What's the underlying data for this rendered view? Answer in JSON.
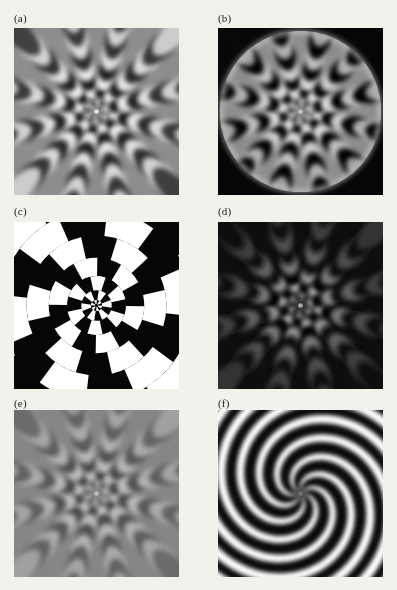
{
  "figure": {
    "kind": "scanned-print-figure",
    "page_background": "#f2f1ec",
    "columns": 2,
    "rows": 3,
    "panels": [
      {
        "id": "a",
        "label": "(a)",
        "shape": "square",
        "description": "Grayscale radial interference pattern, square frame, uniform mid-gray surround",
        "background": "#8a8a8a",
        "mask": "none",
        "sectors": 12,
        "rings": 9,
        "contrast": 1.0,
        "contrast_falloff": "slow",
        "spiral_twist": 0.0,
        "binary": false,
        "x": 14,
        "y": 28,
        "w": 165,
        "h": 167,
        "label_x": 14,
        "label_y": 12
      },
      {
        "id": "b",
        "label": "(b)",
        "shape": "square",
        "description": "Same radial pattern masked by a circular aperture with bright rim glow on black field",
        "background": "#050505",
        "mask": "circle",
        "mask_radius_pct": 49,
        "rim_glow": "#d8d8d8",
        "sectors": 12,
        "rings": 9,
        "contrast": 1.0,
        "contrast_falloff": "slow",
        "spiral_twist": 0.0,
        "binary": false,
        "x": 218,
        "y": 28,
        "w": 165,
        "h": 167,
        "label_x": 218,
        "label_y": 12
      },
      {
        "id": "c",
        "label": "(c)",
        "shape": "square",
        "description": "Hard-thresholded binary pinwheel checkerboard, pure black and white sectors with spiral twist",
        "background": "#050505",
        "mask": "none",
        "sectors": 12,
        "rings": 7,
        "contrast": 1.0,
        "contrast_falloff": "none",
        "spiral_twist": 0.55,
        "binary": true,
        "x": 14,
        "y": 222,
        "w": 165,
        "h": 167,
        "label_x": 14,
        "label_y": 205
      },
      {
        "id": "d",
        "label": "(d)",
        "shape": "square",
        "description": "Radial interference pattern on dark field, contrast concentrated at center and fading to near black",
        "background": "#0d0d0d",
        "mask": "none",
        "sectors": 12,
        "rings": 9,
        "contrast": 0.85,
        "contrast_falloff": "fast",
        "spiral_twist": 0.0,
        "binary": false,
        "x": 218,
        "y": 222,
        "w": 165,
        "h": 167,
        "label_x": 218,
        "label_y": 205
      },
      {
        "id": "e",
        "label": "(e)",
        "shape": "square",
        "description": "Low-contrast radial interference pattern washing out to uniform mid gray at the edges",
        "background": "#838383",
        "mask": "none",
        "sectors": 12,
        "rings": 9,
        "contrast": 0.6,
        "contrast_falloff": "medium",
        "spiral_twist": 0.0,
        "binary": false,
        "x": 14,
        "y": 410,
        "w": 165,
        "h": 167,
        "label_x": 14,
        "label_y": 397
      },
      {
        "id": "f",
        "label": "(f)",
        "shape": "square",
        "description": "Smooth spiral pinwheel with seven white arms curving counterclockwise from a central singularity",
        "background": "#0a0a0a",
        "mask": "none",
        "arms": 7,
        "spiral_turns": 0.85,
        "contrast": 1.0,
        "binary": false,
        "spiral": true,
        "x": 218,
        "y": 410,
        "w": 165,
        "h": 167,
        "label_x": 218,
        "label_y": 397
      }
    ]
  },
  "palette": {
    "white": "#ffffff",
    "black": "#000000",
    "mid_gray": "#8a8a8a",
    "page": "#f2f1ec",
    "label_text": "#1a1a1a"
  }
}
